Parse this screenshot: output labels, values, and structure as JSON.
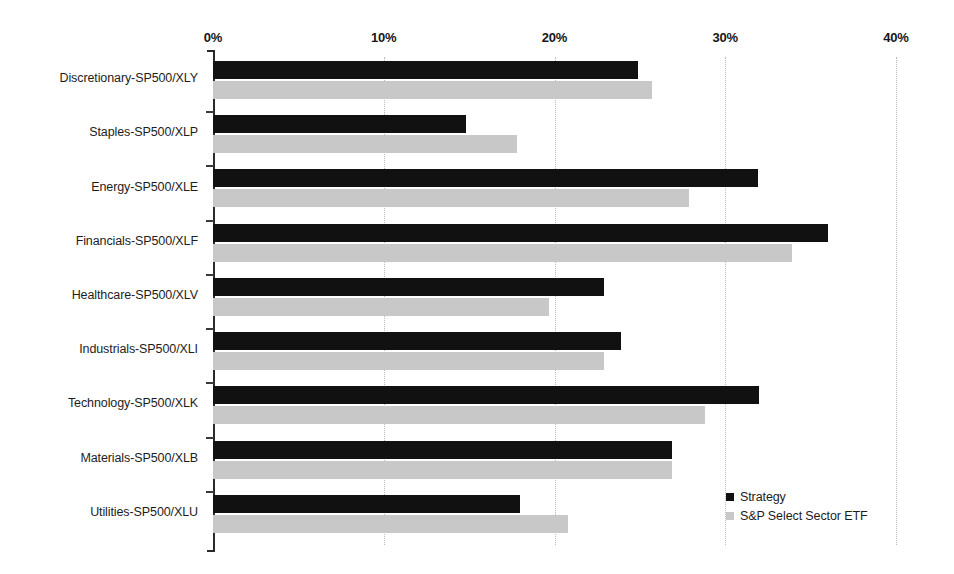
{
  "chart_data": {
    "type": "bar",
    "orientation": "horizontal",
    "title": "",
    "xlabel": "",
    "ylabel": "",
    "xlim": [
      0,
      40
    ],
    "xtick_labels": [
      "0%",
      "10%",
      "20%",
      "30%",
      "40%"
    ],
    "xticks": [
      0,
      10,
      20,
      30,
      40
    ],
    "grid": true,
    "grid_axis": "x",
    "legend_position": "bottom-right",
    "categories": [
      "Discretionary-SP500/XLY",
      "Staples-SP500/XLP",
      "Energy-SP500/XLE",
      "Financials-SP500/XLF",
      "Healthcare-SP500/XLV",
      "Industrials-SP500/XLI",
      "Technology-SP500/XLK",
      "Materials-SP500/XLB",
      "Utilities-SP500/XLU"
    ],
    "series": [
      {
        "name": "Strategy",
        "color": "#111111",
        "values": [
          24.9,
          14.8,
          31.9,
          36.0,
          22.9,
          23.9,
          32.0,
          26.9,
          18.0
        ]
      },
      {
        "name": "S&P Select Sector ETF",
        "color": "#c8c8c8",
        "values": [
          25.7,
          17.8,
          27.9,
          33.9,
          19.7,
          22.9,
          28.8,
          26.9,
          20.8
        ]
      }
    ]
  },
  "legend": {
    "entries": [
      {
        "label": "Strategy",
        "color": "#111111"
      },
      {
        "label": "S&P Select Sector ETF",
        "color": "#c8c8c8"
      }
    ]
  }
}
